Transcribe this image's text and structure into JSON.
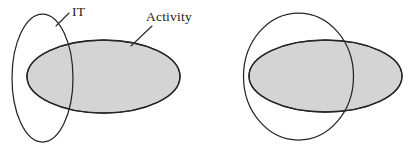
{
  "figure": {
    "type": "venn-diagram-pair",
    "background_color": "#ffffff",
    "outline_color": "#262626",
    "fill_color": "#d4d4d4",
    "label_color": "#1a1a1a"
  },
  "diagrams": [
    {
      "id": "diagram-left",
      "name": "it-activity-partial-overlap",
      "shapes": [
        {
          "name": "it-ellipse",
          "shape": "ellipse",
          "cx": 42.5,
          "cy": 78,
          "rx": 30.5,
          "ry": 64,
          "rotation": 0,
          "filled": false,
          "fill": "none",
          "label": "IT"
        },
        {
          "name": "activity-ellipse",
          "shape": "ellipse",
          "cx": 103.5,
          "cy": 76.5,
          "rx": 76.5,
          "ry": 36.5,
          "rotation": 0,
          "filled": true,
          "fill": "#d4d4d4",
          "label": "Activity"
        }
      ],
      "labels": [
        {
          "name": "it-label",
          "text": "IT",
          "x": 72,
          "y": 16,
          "leader": {
            "x1": 69,
            "y1": 13,
            "x2": 56,
            "y2": 26
          }
        },
        {
          "name": "activity-label",
          "text": "Activity",
          "x": 146,
          "y": 21,
          "leader": {
            "x1": 152,
            "y1": 26,
            "x2": 131,
            "y2": 46
          }
        }
      ]
    },
    {
      "id": "diagram-right",
      "name": "circle-activity-large-overlap",
      "shapes": [
        {
          "name": "circle-set",
          "shape": "circle",
          "cx": 298.5,
          "cy": 76.5,
          "rx": 55,
          "ry": 63.5,
          "rotation": 0,
          "filled": false,
          "fill": "none",
          "label": ""
        },
        {
          "name": "activity-ellipse-right",
          "shape": "ellipse",
          "cx": 325.5,
          "cy": 76,
          "rx": 76.5,
          "ry": 36,
          "rotation": 0,
          "filled": true,
          "fill": "#d4d4d4",
          "label": ""
        }
      ],
      "labels": []
    }
  ]
}
